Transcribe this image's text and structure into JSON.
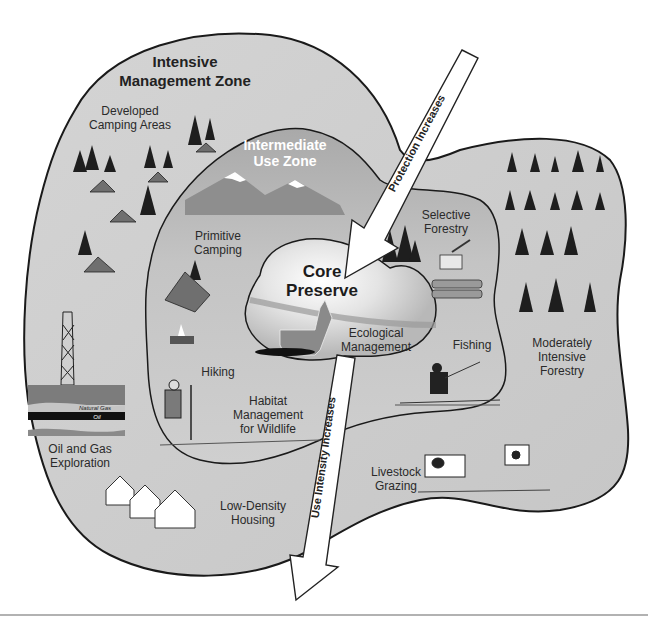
{
  "diagram": {
    "zones": {
      "intensive": {
        "title_line1": "Intensive",
        "title_line2": "Management Zone"
      },
      "intermediate": {
        "title_line1": "Intermediate",
        "title_line2": "Use Zone"
      },
      "core": {
        "title_line1": "Core",
        "title_line2": "Preserve"
      }
    },
    "activities": {
      "developed_camping": [
        "Developed",
        "Camping Areas"
      ],
      "primitive_camping": [
        "Primitive",
        "Camping"
      ],
      "selective_forestry": [
        "Selective",
        "Forestry"
      ],
      "ecological_management": [
        "Ecological",
        "Management"
      ],
      "fishing": "Fishing",
      "moderately_intensive_forestry": [
        "Moderately",
        "Intensive",
        "Forestry"
      ],
      "hiking": "Hiking",
      "habitat_management": [
        "Habitat",
        "Management",
        "for Wildlife"
      ],
      "oil_gas": [
        "Oil and Gas",
        "Exploration"
      ],
      "natural_gas_label": "Natural Gas",
      "oil_label": "Oil",
      "livestock": [
        "Livestock",
        "Grazing"
      ],
      "housing": [
        "Low-Density",
        "Housing"
      ]
    },
    "arrows": {
      "protection": "Protection Increases",
      "use_intensity": "Use Intensity Increases"
    },
    "colors": {
      "outer_fill": "#c9c9c9",
      "middle_fill": "#bdbdbd",
      "core_fill": "#d8d8d8",
      "outline": "#1a1a1a"
    }
  }
}
